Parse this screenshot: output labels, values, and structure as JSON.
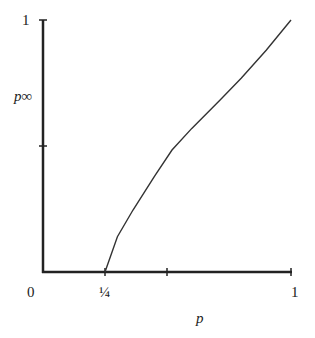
{
  "chart_data": {
    "type": "line",
    "title": "",
    "xlabel": "p",
    "ylabel": "p∞",
    "xlim": [
      0,
      1
    ],
    "ylim": [
      0,
      1
    ],
    "grid": false,
    "x_ticks": [
      0,
      0.25,
      0.5,
      1
    ],
    "x_tick_labels": [
      "0",
      "¼",
      "",
      "1"
    ],
    "y_ticks": [
      0,
      0.5,
      1
    ],
    "y_tick_labels": [
      "",
      "",
      "1"
    ],
    "series": [
      {
        "name": "p∞(p)",
        "x": [
          0.25,
          0.3,
          0.363,
          0.45,
          0.52,
          0.6,
          0.714,
          0.8,
          0.9,
          1.0
        ],
        "y": [
          0.0,
          0.14,
          0.246,
          0.38,
          0.484,
          0.57,
          0.683,
          0.77,
          0.88,
          1.0
        ]
      }
    ]
  },
  "labels": {
    "y_top": "1",
    "y_axis": "p∞",
    "x_zero": "0",
    "x_quarter": "¼",
    "x_one": "1",
    "x_axis": "p"
  }
}
